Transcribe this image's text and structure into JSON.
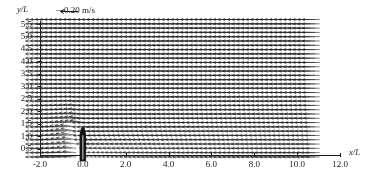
{
  "figure": {
    "kind": "velocity-vector-field",
    "background_color": "#ffffff",
    "foreground_color": "#1a1a1a"
  },
  "axes": {
    "x_label": "x/L",
    "y_label": "y/L",
    "x_ticks": [
      "-2.0",
      "0.0",
      "2.0",
      "4.0",
      "6.0",
      "8.0",
      "10.0",
      "12.0"
    ],
    "x_tick_values": [
      -2.0,
      0.0,
      2.0,
      4.0,
      6.0,
      8.0,
      10.0,
      12.0
    ],
    "y_ticks": [
      "0.5",
      "1.0",
      "1.5",
      "2.0",
      "2.5",
      "3.0",
      "3.5",
      "4.0",
      "4.5",
      "5.0",
      "5.5"
    ],
    "y_tick_values": [
      0.5,
      1.0,
      1.5,
      2.0,
      2.5,
      3.0,
      3.5,
      4.0,
      4.5,
      5.0,
      5.5
    ]
  },
  "scale_legend": {
    "arrow": "—",
    "value": "0.20",
    "units": "m/s",
    "text": "0.20 m/s"
  },
  "chart_data": {
    "type": "quiver",
    "title": "",
    "xlabel": "x/L",
    "ylabel": "y/L",
    "xlim": [
      -2.0,
      12.0
    ],
    "ylim": [
      0.0,
      5.75
    ],
    "grid": false,
    "legend_position": "top-left",
    "reference_vector": {
      "magnitude": 0.2,
      "units": "m/s",
      "direction_deg": 180
    },
    "body": {
      "shape": "bullet",
      "label": "",
      "x_center": 0.0,
      "x_half_width": 0.13,
      "y_base": 0.0,
      "y_tip": 1.35,
      "nose_start_y": 0.95,
      "fill": "#111111"
    },
    "grid_spec": {
      "x_start": -1.85,
      "x_end": 11.05,
      "nx": 60,
      "y_start": 0.16,
      "y_end": 5.68,
      "ny": 33
    },
    "flow_model": {
      "freestream_u": -0.2,
      "freestream_v": 0.0,
      "wake_center_y": 0.0,
      "wake_half_width_near": 0.55,
      "wake_spread": 0.13,
      "wake_deficit": 0.92,
      "upwash_strength": 0.3,
      "note": "Uniform leftward freestream with a momentum-deficit wake trailing downstream (to +x) of the bullet body, plus weak upward deflection above the nose."
    }
  }
}
